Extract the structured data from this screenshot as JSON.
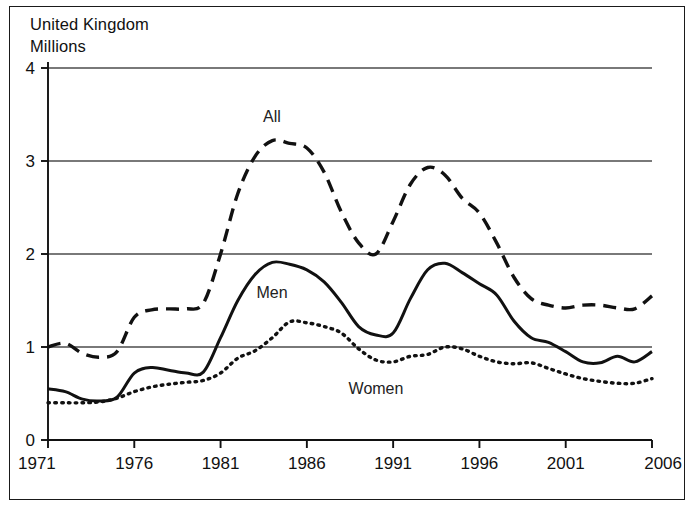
{
  "figure": {
    "region_label": "United Kingdom",
    "unit_label": "Millions"
  },
  "axes": {
    "y_ticks": [
      "0",
      "1",
      "2",
      "3",
      "4"
    ],
    "x_ticks": [
      "1971",
      "1976",
      "1981",
      "1986",
      "1991",
      "1996",
      "2001",
      "2006"
    ]
  },
  "series_labels": {
    "all": "All",
    "men": "Men",
    "women": "Women"
  },
  "colors": {
    "line": "#111111",
    "grid": "#4d4d4d",
    "frame": "#1a1a1a",
    "background": "#ffffff"
  },
  "chart_data": {
    "type": "line",
    "title": "United Kingdom",
    "subtitle": "Millions",
    "xlabel": "",
    "ylabel": "Millions",
    "xlim": [
      1971,
      2006
    ],
    "ylim": [
      0,
      4
    ],
    "grid": true,
    "legend": "inline-annotations",
    "x_tick_labels": [
      "1971",
      "1976",
      "1981",
      "1986",
      "1991",
      "1996",
      "2001",
      "2006"
    ],
    "y_tick_labels": [
      "0",
      "1",
      "2",
      "3",
      "4"
    ],
    "x": [
      1971,
      1972,
      1973,
      1974,
      1975,
      1976,
      1977,
      1978,
      1979,
      1980,
      1981,
      1982,
      1983,
      1984,
      1985,
      1986,
      1987,
      1988,
      1989,
      1990,
      1991,
      1992,
      1993,
      1994,
      1995,
      1996,
      1997,
      1998,
      1999,
      2000,
      2001,
      2002,
      2003,
      2004,
      2005,
      2006
    ],
    "series": [
      {
        "name": "All",
        "style": "dashed",
        "values": [
          1.0,
          1.04,
          0.93,
          0.89,
          0.95,
          1.32,
          1.4,
          1.41,
          1.41,
          1.47,
          2.0,
          2.65,
          3.05,
          3.22,
          3.19,
          3.14,
          2.88,
          2.45,
          2.12,
          2.0,
          2.35,
          2.75,
          2.93,
          2.85,
          2.6,
          2.44,
          2.12,
          1.75,
          1.52,
          1.45,
          1.42,
          1.45,
          1.45,
          1.42,
          1.41,
          1.55
        ]
      },
      {
        "name": "Men",
        "style": "solid",
        "values": [
          0.55,
          0.52,
          0.44,
          0.42,
          0.46,
          0.72,
          0.78,
          0.75,
          0.72,
          0.73,
          1.1,
          1.5,
          1.78,
          1.91,
          1.89,
          1.83,
          1.7,
          1.48,
          1.22,
          1.13,
          1.15,
          1.52,
          1.83,
          1.9,
          1.8,
          1.68,
          1.56,
          1.28,
          1.1,
          1.05,
          0.95,
          0.84,
          0.83,
          0.9,
          0.84,
          0.95
        ]
      },
      {
        "name": "Women",
        "style": "dotted",
        "values": [
          0.4,
          0.4,
          0.4,
          0.41,
          0.45,
          0.52,
          0.57,
          0.6,
          0.62,
          0.64,
          0.72,
          0.88,
          0.96,
          1.1,
          1.27,
          1.26,
          1.22,
          1.15,
          0.98,
          0.86,
          0.84,
          0.9,
          0.92,
          1.0,
          0.98,
          0.9,
          0.84,
          0.82,
          0.83,
          0.77,
          0.71,
          0.66,
          0.63,
          0.61,
          0.61,
          0.66
        ]
      }
    ]
  }
}
